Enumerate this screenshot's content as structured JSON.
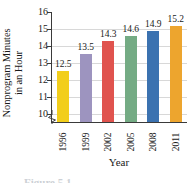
{
  "chart_data": {
    "type": "bar",
    "title": "",
    "xlabel": "Year",
    "ylabel_line1": "Nonprogram Minutes",
    "ylabel_line2": "in an Hour",
    "categories": [
      "1996",
      "1999",
      "2002",
      "2005",
      "2008",
      "2011"
    ],
    "values": [
      12.5,
      13.5,
      14.3,
      14.6,
      14.9,
      15.2
    ],
    "value_labels": [
      "12.5",
      "13.5",
      "14.3",
      "14.6",
      "14.9",
      "15.2"
    ],
    "ylim": [
      9.5,
      16
    ],
    "yticks": [
      10,
      11,
      12,
      13,
      14,
      15,
      16
    ],
    "ytick_labels": [
      "10",
      "11",
      "12",
      "13",
      "14",
      "15",
      "16"
    ],
    "grid": true,
    "legend": "none",
    "axis_break": true,
    "bar_colors": [
      "#f2ce1b",
      "#9d94bf",
      "#e0534e",
      "#74ab84",
      "#3b72b0",
      "#eda52e"
    ]
  },
  "caption": {
    "text": "Figure 5.1"
  }
}
